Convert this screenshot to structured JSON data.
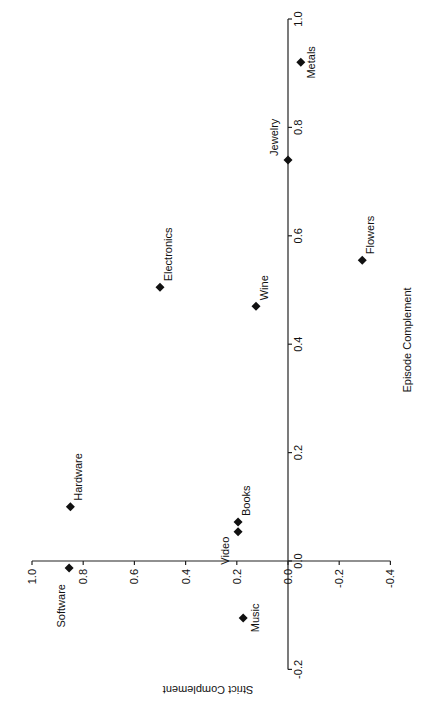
{
  "chart_data": {
    "type": "scatter",
    "title": "",
    "orientation_note": "figure rotated 90 degrees; x axis drawn vertically, y axis drawn horizontally",
    "xlabel": "Episode Complement",
    "ylabel": "Strict Complement",
    "xlim": [
      -0.2,
      1.0
    ],
    "ylim": [
      -0.4,
      1.0
    ],
    "x_ticks": [
      "-0.2",
      "0.0",
      "0.2",
      "0.4",
      "0.6",
      "0.8",
      "1.0"
    ],
    "x_tick_values": [
      -0.2,
      0.0,
      0.2,
      0.4,
      0.6,
      0.8,
      1.0
    ],
    "y_ticks": [
      "-0.4",
      "-0.2",
      "0.0",
      "0.2",
      "0.4",
      "0.6",
      "0.8",
      "1.0"
    ],
    "y_tick_values": [
      -0.4,
      -0.2,
      0.0,
      0.2,
      0.4,
      0.6,
      0.8,
      1.0
    ],
    "grid": false,
    "legend": "none",
    "marker": "diamond",
    "points": [
      {
        "label": "Metals",
        "x": 0.92,
        "y": -0.05
      },
      {
        "label": "Jewelry",
        "x": 0.74,
        "y": 0.0
      },
      {
        "label": "Flowers",
        "x": 0.555,
        "y": -0.29
      },
      {
        "label": "Electronics",
        "x": 0.505,
        "y": 0.5
      },
      {
        "label": "Wine",
        "x": 0.47,
        "y": 0.125
      },
      {
        "label": "Hardware",
        "x": 0.1,
        "y": 0.85
      },
      {
        "label": "Books",
        "x": 0.072,
        "y": 0.195
      },
      {
        "label": "Video",
        "x": 0.054,
        "y": 0.195
      },
      {
        "label": "Software",
        "x": -0.013,
        "y": 0.855
      },
      {
        "label": "Music",
        "x": -0.105,
        "y": 0.175
      }
    ]
  }
}
